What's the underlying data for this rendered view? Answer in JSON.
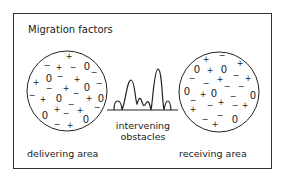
{
  "title": "Migration factors",
  "labels": {
    "delivering": "delivering area",
    "receiving": "receiving area",
    "obstacles_line1": "intervening",
    "obstacles_line2": "obstacles"
  },
  "legend_symbols": {
    "plus": "+",
    "minus": "−",
    "zero": "0"
  },
  "left_circle": {
    "cx": 67,
    "cy": 91,
    "r": 40,
    "symbols": [
      {
        "t": "+",
        "x": 69,
        "y": 59
      },
      {
        "t": "−",
        "x": 47,
        "y": 68
      },
      {
        "t": "+",
        "x": 59,
        "y": 70
      },
      {
        "t": "−",
        "x": 73,
        "y": 70
      },
      {
        "t": "0",
        "x": 87,
        "y": 70
      },
      {
        "t": "−",
        "x": 94,
        "y": 75
      },
      {
        "t": "0",
        "x": 49,
        "y": 82
      },
      {
        "t": "−",
        "x": 60,
        "y": 79
      },
      {
        "t": "+",
        "x": 77,
        "y": 82
      },
      {
        "t": "+",
        "x": 36,
        "y": 85
      },
      {
        "t": "−",
        "x": 49,
        "y": 91
      },
      {
        "t": "+",
        "x": 66,
        "y": 91
      },
      {
        "t": "0",
        "x": 87,
        "y": 91
      },
      {
        "t": "−",
        "x": 99,
        "y": 86
      },
      {
        "t": "−",
        "x": 32,
        "y": 98
      },
      {
        "t": "+",
        "x": 43,
        "y": 102
      },
      {
        "t": "0",
        "x": 59,
        "y": 102
      },
      {
        "t": "−",
        "x": 76,
        "y": 96
      },
      {
        "t": "+",
        "x": 89,
        "y": 101
      },
      {
        "t": "0",
        "x": 101,
        "y": 102
      },
      {
        "t": "−",
        "x": 71,
        "y": 107
      },
      {
        "t": "−",
        "x": 97,
        "y": 110
      },
      {
        "t": "0",
        "x": 45,
        "y": 119
      },
      {
        "t": "+",
        "x": 57,
        "y": 112
      },
      {
        "t": "−",
        "x": 66,
        "y": 116
      },
      {
        "t": "+",
        "x": 80,
        "y": 113
      },
      {
        "t": "0",
        "x": 86,
        "y": 123
      },
      {
        "t": "−",
        "x": 57,
        "y": 127
      },
      {
        "t": "+",
        "x": 70,
        "y": 128
      }
    ]
  },
  "right_circle": {
    "cx": 219,
    "cy": 92,
    "r": 40,
    "symbols": [
      {
        "t": "+",
        "x": 206,
        "y": 62
      },
      {
        "t": "−",
        "x": 222,
        "y": 58
      },
      {
        "t": "+",
        "x": 240,
        "y": 66
      },
      {
        "t": "0",
        "x": 197,
        "y": 73
      },
      {
        "t": "+",
        "x": 210,
        "y": 73
      },
      {
        "t": "0",
        "x": 224,
        "y": 73
      },
      {
        "t": "−",
        "x": 192,
        "y": 81
      },
      {
        "t": "+",
        "x": 220,
        "y": 82
      },
      {
        "t": "−",
        "x": 236,
        "y": 78
      },
      {
        "t": "+",
        "x": 248,
        "y": 81
      },
      {
        "t": "−",
        "x": 206,
        "y": 86
      },
      {
        "t": "−",
        "x": 227,
        "y": 89
      },
      {
        "t": "−",
        "x": 241,
        "y": 89
      },
      {
        "t": "0",
        "x": 187,
        "y": 95
      },
      {
        "t": "+",
        "x": 203,
        "y": 97
      },
      {
        "t": "0",
        "x": 214,
        "y": 97
      },
      {
        "t": "−",
        "x": 233,
        "y": 99
      },
      {
        "t": "0",
        "x": 253,
        "y": 99
      },
      {
        "t": "−",
        "x": 193,
        "y": 103
      },
      {
        "t": "+",
        "x": 221,
        "y": 105
      },
      {
        "t": "−",
        "x": 235,
        "y": 108
      },
      {
        "t": "+",
        "x": 193,
        "y": 112
      },
      {
        "t": "−",
        "x": 210,
        "y": 108
      },
      {
        "t": "+",
        "x": 245,
        "y": 108
      },
      {
        "t": "−",
        "x": 205,
        "y": 122
      },
      {
        "t": "−",
        "x": 220,
        "y": 118
      },
      {
        "t": "+",
        "x": 215,
        "y": 127
      },
      {
        "t": "0",
        "x": 235,
        "y": 123
      }
    ]
  },
  "obstacle_profile": {
    "baseline": {
      "x1": 107,
      "x2": 178,
      "y": 110
    },
    "path": "M114 110 C114 98, 121 98, 122 110 M122 110 C126 100, 127 80, 131 80 C135 80, 135 100, 137 104 C139 98, 140 96, 142 102 C144 108, 144 106, 147 102 C149 100, 150 106, 151 110 M151 110 C153 100, 154 70, 158 69 C162 69, 162 100, 164 110 M164 110 C166 98, 170 98, 171 110"
  }
}
